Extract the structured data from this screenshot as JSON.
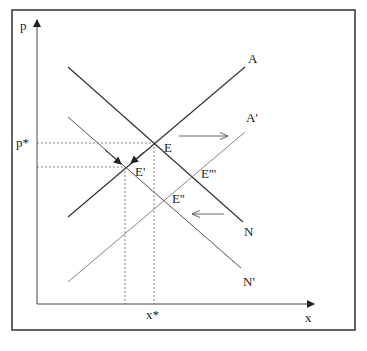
{
  "diagram": {
    "axes": {
      "y_label": "p",
      "x_label": "x",
      "y_tick_label": "p*",
      "x_tick_label": "x*"
    },
    "curves": [
      {
        "id": "A",
        "label": "A",
        "type": "supply",
        "style": "solid"
      },
      {
        "id": "N",
        "label": "N",
        "type": "demand",
        "style": "solid"
      },
      {
        "id": "A_prime",
        "label": "A'",
        "type": "supply",
        "style": "solid-light"
      },
      {
        "id": "N_prime",
        "label": "N'",
        "type": "demand",
        "style": "solid-light"
      }
    ],
    "points": [
      {
        "id": "E",
        "label": "E"
      },
      {
        "id": "E1",
        "label": "E'"
      },
      {
        "id": "E2",
        "label": "E''"
      },
      {
        "id": "E3",
        "label": "E'''"
      }
    ],
    "arrows": [
      {
        "id": "shift-right",
        "direction": "right"
      },
      {
        "id": "shift-left",
        "direction": "left"
      }
    ]
  },
  "colors": {
    "line": "#333333",
    "light_line": "#666666",
    "frame": "#333333"
  }
}
